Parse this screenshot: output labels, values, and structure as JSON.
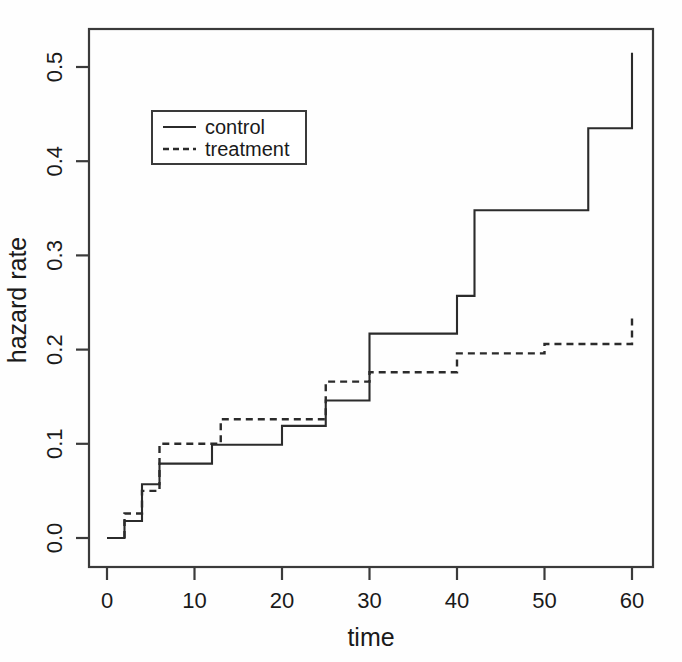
{
  "chart_data": {
    "type": "line",
    "subtype": "step",
    "title": "",
    "xlabel": "time",
    "ylabel": "hazard rate",
    "xlim": [
      -2,
      62
    ],
    "ylim": [
      -0.015,
      0.545
    ],
    "xticks": [
      0,
      10,
      20,
      30,
      40,
      50,
      60
    ],
    "xtick_labels": [
      "0",
      "10",
      "20",
      "30",
      "40",
      "50",
      "60"
    ],
    "yticks": [
      0.0,
      0.1,
      0.2,
      0.3,
      0.4,
      0.5
    ],
    "ytick_labels": [
      "0.0",
      "0.1",
      "0.2",
      "0.3",
      "0.4",
      "0.5"
    ],
    "grid": false,
    "frame": "box",
    "legend": {
      "position": "top-left-inside",
      "entries": [
        {
          "label": "control",
          "style": "solid"
        },
        {
          "label": "treatment",
          "style": "dashed"
        }
      ]
    },
    "series": [
      {
        "name": "control",
        "style": "solid",
        "x": [
          0,
          2,
          2,
          4,
          4,
          6,
          6,
          12,
          12,
          20,
          20,
          25,
          25,
          30,
          30,
          40,
          40,
          42,
          42,
          55,
          55,
          60,
          60
        ],
        "y": [
          0.0,
          0.0,
          0.018,
          0.018,
          0.057,
          0.057,
          0.079,
          0.079,
          0.099,
          0.099,
          0.119,
          0.119,
          0.146,
          0.146,
          0.217,
          0.217,
          0.257,
          0.257,
          0.348,
          0.348,
          0.435,
          0.435,
          0.495
        ],
        "steps": [
          {
            "t": 0,
            "value": 0.0
          },
          {
            "t": 2,
            "value": 0.018
          },
          {
            "t": 4,
            "value": 0.057
          },
          {
            "t": 6,
            "value": 0.079
          },
          {
            "t": 12,
            "value": 0.099
          },
          {
            "t": 20,
            "value": 0.119
          },
          {
            "t": 25,
            "value": 0.146
          },
          {
            "t": 30,
            "value": 0.217
          },
          {
            "t": 40,
            "value": 0.257
          },
          {
            "t": 42,
            "value": 0.348
          },
          {
            "t": 55,
            "value": 0.435
          },
          {
            "t": 60,
            "value": 0.495
          },
          {
            "t": 60,
            "value": 0.515
          }
        ]
      },
      {
        "name": "treatment",
        "style": "dashed",
        "steps": [
          {
            "t": 2,
            "value": 0.0
          },
          {
            "t": 2,
            "value": 0.026
          },
          {
            "t": 4,
            "value": 0.05
          },
          {
            "t": 6,
            "value": 0.1
          },
          {
            "t": 12,
            "value": 0.1
          },
          {
            "t": 13,
            "value": 0.126
          },
          {
            "t": 20,
            "value": 0.126
          },
          {
            "t": 25,
            "value": 0.166
          },
          {
            "t": 30,
            "value": 0.176
          },
          {
            "t": 40,
            "value": 0.196
          },
          {
            "t": 50,
            "value": 0.206
          },
          {
            "t": 60,
            "value": 0.206
          },
          {
            "t": 60,
            "value": 0.235
          }
        ]
      }
    ],
    "colors": {
      "line": "#2b2b2b",
      "axis": "#3a3a3a",
      "text": "#1a1a1a",
      "background": "#fefefe"
    }
  },
  "axes": {
    "x_title": "time",
    "y_title": "hazard rate"
  },
  "x_tick_labels": {
    "t0": "0",
    "t10": "10",
    "t20": "20",
    "t30": "30",
    "t40": "40",
    "t50": "50",
    "t60": "60"
  },
  "y_tick_labels": {
    "v00": "0.0",
    "v01": "0.1",
    "v02": "0.2",
    "v03": "0.3",
    "v04": "0.4",
    "v05": "0.5"
  },
  "legend": {
    "control_label": "control",
    "treatment_label": "treatment"
  }
}
